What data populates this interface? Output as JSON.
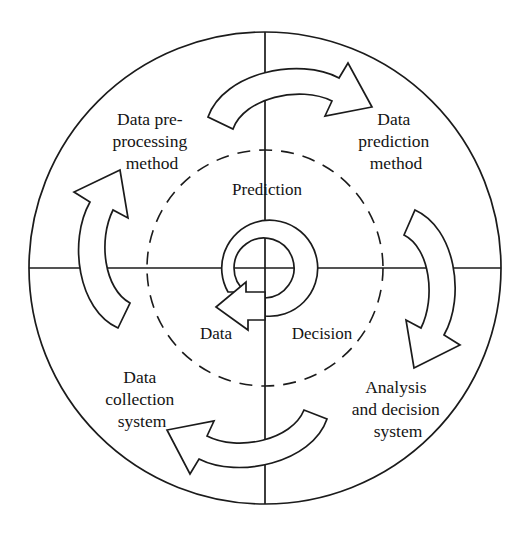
{
  "diagram": {
    "type": "cyclic-quadrant-diagram",
    "colors": {
      "stroke": "#1b1b1b",
      "background": "#ffffff",
      "text": "#141414"
    },
    "geometry": {
      "center_x": 265,
      "center_y": 268,
      "outer_radius": 236,
      "dashed_radius": 118,
      "inner_spiral_outer_radius": 48,
      "inner_spiral_inner_radius": 30,
      "axis_note": "vertical and horizontal diameters drawn across the outer circle"
    },
    "quadrant_labels": [
      {
        "id": "top-left",
        "lines": [
          "Data pre-",
          "processing",
          "method"
        ],
        "x": 152,
        "y": 125
      },
      {
        "id": "top-right",
        "lines": [
          "Data",
          "prediction",
          "method"
        ],
        "x": 396,
        "y": 125
      },
      {
        "id": "bottom-left",
        "lines": [
          "Data",
          "collection",
          "system"
        ],
        "x": 142,
        "y": 383
      },
      {
        "id": "bottom-right",
        "lines": [
          "Analysis",
          "and decision",
          "system"
        ],
        "x": 398,
        "y": 393
      }
    ],
    "inner_labels": [
      {
        "id": "prediction",
        "text": "Prediction",
        "x": 267,
        "y": 195
      },
      {
        "id": "data",
        "text": "Data",
        "x": 216,
        "y": 339
      },
      {
        "id": "decision",
        "text": "Decision",
        "x": 322,
        "y": 339
      }
    ],
    "arrows": [
      {
        "id": "top-arrow",
        "position": "top",
        "direction": "clockwise",
        "points_to": "right"
      },
      {
        "id": "right-arrow",
        "position": "right",
        "direction": "clockwise",
        "points_to": "down"
      },
      {
        "id": "bottom-arrow",
        "position": "bottom",
        "direction": "clockwise",
        "points_to": "left"
      },
      {
        "id": "left-arrow",
        "position": "left",
        "direction": "clockwise",
        "points_to": "up"
      },
      {
        "id": "center-spiral-arrow",
        "position": "center",
        "direction": "clockwise",
        "points_to": "down-left"
      }
    ]
  }
}
